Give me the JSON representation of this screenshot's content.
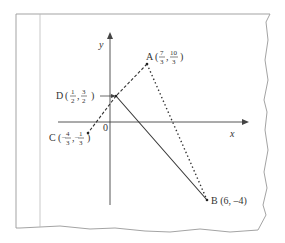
{
  "diagram": {
    "type": "coordinate-geometry",
    "axes": {
      "x_label": "x",
      "y_label": "y",
      "origin_label": "0"
    },
    "points": [
      {
        "id": "A",
        "name": "A",
        "x_num": "7",
        "x_den": "3",
        "y_num": "10",
        "y_den": "3",
        "x": 2.3333,
        "y": 3.3333
      },
      {
        "id": "B",
        "name": "B",
        "coords_text": "(6, –4)",
        "x": 6,
        "y": -4
      },
      {
        "id": "C",
        "name": "C",
        "x_num": "4",
        "x_den": "3",
        "x_sign": "–",
        "y_num": "1",
        "y_den": "3",
        "y_sign": "–",
        "x": -1.3333,
        "y": -0.3333
      },
      {
        "id": "D",
        "name": "D",
        "x_num": "1",
        "x_den": "2",
        "y_num": "3",
        "y_den": "2",
        "x": 0.5,
        "y": 1.5
      }
    ],
    "segments": [
      {
        "from": "A",
        "to": "D",
        "style": "dashed"
      },
      {
        "from": "D",
        "to": "C",
        "style": "dashed"
      },
      {
        "from": "D",
        "to": "B",
        "style": "solid"
      },
      {
        "from": "A",
        "to": "B",
        "style": "dotted"
      }
    ],
    "colors": {
      "line": "#333333",
      "paper_edge": "#999999",
      "margin_line": "#bbbbbb"
    }
  },
  "labels": {
    "A": {
      "letter": "A",
      "open": "(",
      "comma": ",",
      "close": ")",
      "xn": "7",
      "xd": "3",
      "yn": "10",
      "yd": "3"
    },
    "B": {
      "text": "B (6, –4)"
    },
    "C": {
      "letter": "C",
      "open": "(",
      "comma": ",",
      "close": ")",
      "xs": "–",
      "xn": "4",
      "xd": "3",
      "ys": "–",
      "yn": "1",
      "yd": "3"
    },
    "D": {
      "letter": "D",
      "open": "(",
      "comma": ",",
      "close": ")",
      "xn": "1",
      "xd": "2",
      "yn": "3",
      "yd": "2"
    },
    "axis_x": "x",
    "axis_y": "y",
    "origin": "0"
  }
}
